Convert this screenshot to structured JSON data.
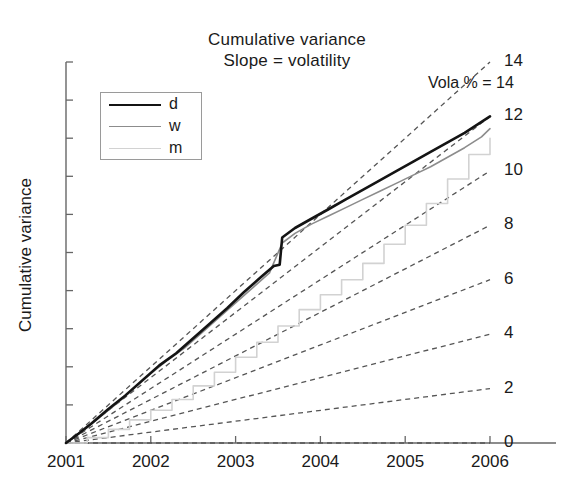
{
  "chart_data": {
    "type": "line",
    "title": "Cumulative variance",
    "subtitle": "Slope = volatility",
    "xlabel": "",
    "ylabel": "Cumulative variance",
    "xlim": [
      2001,
      2006
    ],
    "ylim": [
      0,
      14
    ],
    "grid": false,
    "x_ticks": [
      "2001",
      "2002",
      "2003",
      "2004",
      "2005",
      "2006"
    ],
    "y_ticks_labeled": false,
    "y_tick_count": 11,
    "legend": {
      "position": "upper-left-inside",
      "entries": [
        {
          "label": "d",
          "style": "solid",
          "color": "#141414",
          "width": 2.6
        },
        {
          "label": "w",
          "style": "solid",
          "color": "#8c8c8c",
          "width": 1.6
        },
        {
          "label": "m",
          "style": "solid",
          "color": "#d2d2d2",
          "width": 1.6
        }
      ]
    },
    "annotation": "Vola % = 14",
    "reference_lines": {
      "description": "Straight dashed rays from origin; right-edge labels give implied annual volatility in percent",
      "style": "dashed",
      "color": "#555555",
      "labels": [
        "14",
        "12",
        "10",
        "8",
        "6",
        "4",
        "2",
        "0"
      ],
      "values": [
        14,
        12,
        10,
        8,
        6,
        4,
        2,
        0
      ],
      "end_y_at_2006": [
        14.0,
        12.0,
        10.0,
        8.0,
        6.0,
        4.0,
        2.0,
        0.0
      ]
    },
    "series": [
      {
        "name": "d",
        "label": "d",
        "color": "#141414",
        "x": [
          2001.0,
          2001.15,
          2001.3,
          2001.5,
          2001.7,
          2001.9,
          2002.1,
          2002.3,
          2002.5,
          2002.7,
          2002.9,
          2003.1,
          2003.3,
          2003.45,
          2003.52,
          2003.55,
          2003.7,
          2003.9,
          2004.1,
          2004.3,
          2004.5,
          2004.7,
          2004.9,
          2005.1,
          2005.3,
          2005.5,
          2005.7,
          2005.9,
          2006.0
        ],
        "y": [
          0.0,
          0.35,
          0.72,
          1.25,
          1.75,
          2.3,
          2.85,
          3.3,
          3.85,
          4.4,
          4.95,
          5.55,
          6.1,
          6.5,
          6.55,
          7.55,
          7.9,
          8.25,
          8.6,
          8.95,
          9.3,
          9.65,
          10.0,
          10.35,
          10.7,
          11.05,
          11.4,
          11.8,
          12.0
        ]
      },
      {
        "name": "w",
        "label": "w",
        "color": "#8c8c8c",
        "x": [
          2001.0,
          2001.2,
          2001.4,
          2001.6,
          2001.8,
          2002.0,
          2002.2,
          2002.4,
          2002.6,
          2002.8,
          2003.0,
          2003.2,
          2003.4,
          2003.55,
          2003.7,
          2003.9,
          2004.1,
          2004.3,
          2004.5,
          2004.7,
          2004.9,
          2005.1,
          2005.3,
          2005.5,
          2005.7,
          2005.9,
          2006.0
        ],
        "y": [
          0.0,
          0.45,
          0.95,
          1.45,
          2.0,
          2.55,
          3.05,
          3.5,
          4.05,
          4.6,
          5.15,
          5.7,
          6.25,
          7.35,
          7.7,
          8.05,
          8.35,
          8.65,
          8.95,
          9.25,
          9.55,
          9.85,
          10.15,
          10.5,
          10.85,
          11.25,
          11.55
        ]
      },
      {
        "name": "m",
        "label": "m",
        "color": "#d2d2d2",
        "style": "step",
        "x": [
          2001.0,
          2001.25,
          2001.5,
          2001.75,
          2002.0,
          2002.25,
          2002.5,
          2002.75,
          2003.0,
          2003.25,
          2003.5,
          2003.75,
          2004.0,
          2004.25,
          2004.5,
          2004.75,
          2005.0,
          2005.25,
          2005.5,
          2005.75,
          2006.0
        ],
        "y": [
          0.0,
          0.2,
          0.5,
          0.85,
          1.2,
          1.6,
          2.1,
          2.6,
          3.15,
          3.7,
          4.3,
          4.9,
          5.45,
          6.0,
          6.6,
          7.3,
          8.0,
          8.8,
          9.7,
          10.6,
          11.2
        ]
      }
    ]
  },
  "axes": {
    "x_ticks": [
      {
        "label": "2001",
        "value": 2001
      },
      {
        "label": "2002",
        "value": 2002
      },
      {
        "label": "2003",
        "value": 2003
      },
      {
        "label": "2004",
        "value": 2004
      },
      {
        "label": "2005",
        "value": 2005
      },
      {
        "label": "2006",
        "value": 2006
      }
    ]
  }
}
